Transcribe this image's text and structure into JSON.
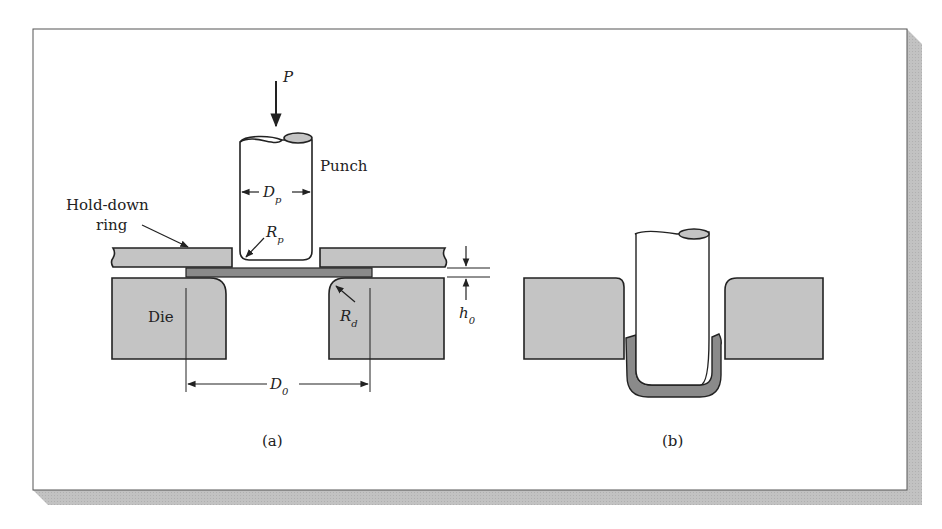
{
  "figure": {
    "panels": [
      {
        "id": "a",
        "caption": "(a)",
        "labels": {
          "force": "P",
          "punch": "Punch",
          "punch_diameter": "D",
          "punch_diameter_sub": "p",
          "hold_down_ring_line1": "Hold-down",
          "hold_down_ring_line2": "ring",
          "punch_radius": "R",
          "punch_radius_sub": "p",
          "die": "Die",
          "die_radius": "R",
          "die_radius_sub": "d",
          "thickness": "h",
          "thickness_sub": "0",
          "blank_diameter": "D",
          "blank_diameter_sub": "0"
        }
      },
      {
        "id": "b",
        "caption": "(b)"
      }
    ],
    "colors": {
      "tool_fill": "#c4c4c4",
      "blank_fill": "#8a8a8a",
      "outline": "#2a2a2a",
      "shadow": "#bdbdbd",
      "frame_border": "#555555",
      "background": "#ffffff"
    }
  }
}
